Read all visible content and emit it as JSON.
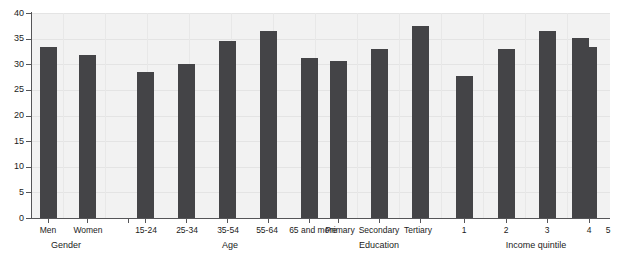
{
  "chart_data": {
    "type": "bar",
    "title": "",
    "subtitle": "",
    "xlabel": "",
    "ylabel": "",
    "ylim": [
      0,
      40
    ],
    "yticks": [
      0,
      5,
      10,
      15,
      20,
      25,
      30,
      35,
      40
    ],
    "grid": true,
    "legend": null,
    "bar_color": "#444447",
    "plot_background": "#f2f2f2",
    "groups": [
      {
        "name": "Gender",
        "categories": [
          "Men",
          "Women"
        ],
        "values": [
          33.4,
          31.8
        ]
      },
      {
        "name": "Age",
        "categories": [
          "15-24",
          "25-34",
          "35-54",
          "55-64",
          "65 and more"
        ],
        "values": [
          28.5,
          30.0,
          34.6,
          36.4,
          31.2
        ]
      },
      {
        "name": "Education",
        "categories": [
          "Primary",
          "Secondary",
          "Tertiary"
        ],
        "values": [
          30.6,
          33.0,
          37.4
        ]
      },
      {
        "name": "Income quintile",
        "categories": [
          "1",
          "2",
          "3",
          "4",
          "5"
        ],
        "values": [
          27.8,
          33.0,
          36.5,
          35.2,
          33.4
        ]
      }
    ]
  },
  "axis": {
    "y_tick_labels": [
      "0",
      "5",
      "10",
      "15",
      "20",
      "25",
      "30",
      "35",
      "40"
    ]
  },
  "labels": {
    "men": "Men",
    "women": "Women",
    "gender": "Gender",
    "a15_24": "15-24",
    "a25_34": "25-34",
    "a35_54": "35-54",
    "a55_64": "55-64",
    "a65plus": "65 and more",
    "age": "Age",
    "primary": "Primary",
    "secondary": "Secondary",
    "tertiary": "Tertiary",
    "education": "Education",
    "q1": "1",
    "q2": "2",
    "q3": "3",
    "q4": "4",
    "q5": "5",
    "income_quintile": "Income quintile"
  }
}
